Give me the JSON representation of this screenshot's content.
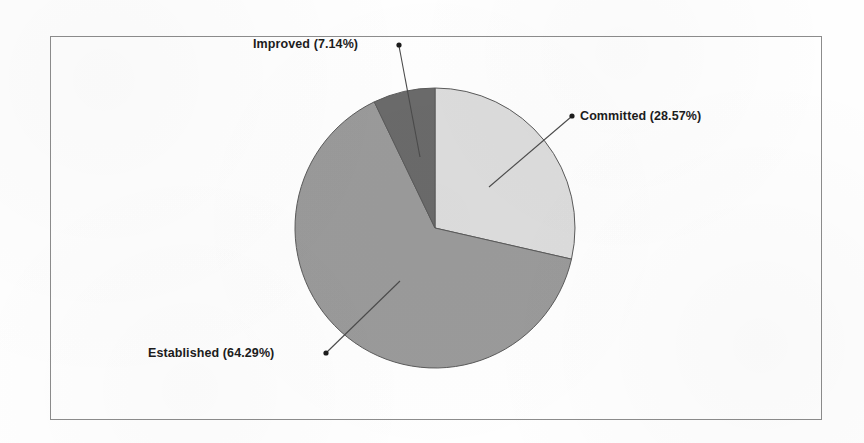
{
  "chart_data": {
    "type": "pie",
    "title": "",
    "subtitle": "",
    "xlabel": "",
    "ylabel": "",
    "grid": false,
    "legend": "none",
    "label_format": "name (percent%)",
    "start_angle_deg": 0,
    "direction": "clockwise",
    "categories": [
      "Committed",
      "Established",
      "Improved"
    ],
    "values": [
      28.57,
      64.29,
      7.14
    ],
    "unit": "%",
    "slices": [
      {
        "name": "Committed",
        "percent": 28.57,
        "label": "Committed (28.57%)",
        "color": "#dcdcdc",
        "start_angle_deg": 0,
        "end_angle_deg": 102.85
      },
      {
        "name": "Established",
        "percent": 64.29,
        "label": "Established (64.29%)",
        "color": "#9a9a9a",
        "start_angle_deg": 102.85,
        "end_angle_deg": 334.29
      },
      {
        "name": "Improved",
        "percent": 7.14,
        "label": "Improved (7.14%)",
        "color": "#6a6a6a",
        "start_angle_deg": 334.29,
        "end_angle_deg": 360
      }
    ]
  },
  "labels": {
    "improved": "Improved (7.14%)",
    "committed": "Committed (28.57%)",
    "established": "Established (64.29%)"
  },
  "colors": {
    "committed_slice": "#dcdcdc",
    "established_slice": "#9a9a9a",
    "improved_slice": "#6a6a6a",
    "slice_outline": "#5a5a5a",
    "frame_border": "#8c8c8c",
    "leader_line": "#4a4a4a",
    "label_text": "#1c1c1c",
    "background": "#fefefe"
  },
  "geometry": {
    "pie_center_x": 435,
    "pie_center_y": 228,
    "pie_radius": 140
  }
}
